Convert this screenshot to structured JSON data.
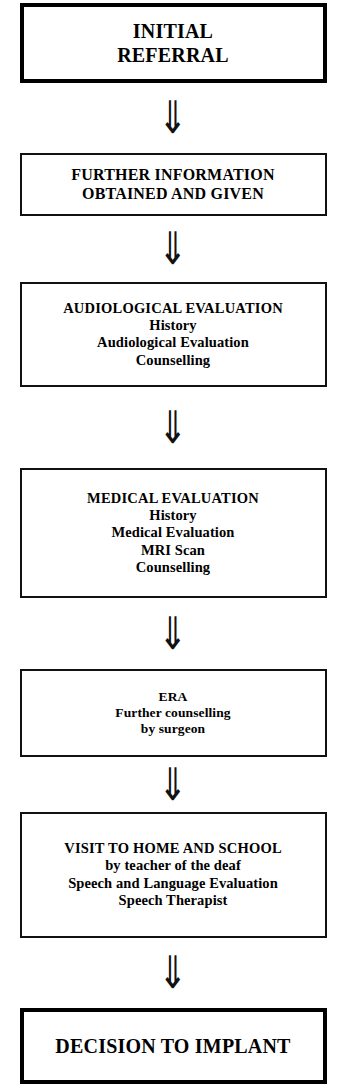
{
  "diagram": {
    "orientation": "vertical-top-down",
    "connector_glyph": "⇓",
    "connector_name": "double-down-arrow",
    "background_color": "#ffffff",
    "line_color": "#111111",
    "text_color": "#000000",
    "nodes": [
      {
        "id": "initial-referral",
        "title": "INITIAL\nREFERRAL",
        "lines": [],
        "emphasis": true,
        "size": "xl"
      },
      {
        "id": "further-information",
        "title": "FURTHER INFORMATION\nOBTAINED AND GIVEN",
        "lines": [],
        "emphasis": false,
        "size": "lg"
      },
      {
        "id": "audiological-evaluation",
        "title": "AUDIOLOGICAL EVALUATION",
        "lines": [
          "History",
          "Audiological Evaluation",
          "Counselling"
        ],
        "emphasis": false,
        "size": "md"
      },
      {
        "id": "medical-evaluation",
        "title": "MEDICAL EVALUATION",
        "lines": [
          "History",
          "Medical Evaluation",
          "MRI Scan",
          "Counselling"
        ],
        "emphasis": false,
        "size": "md"
      },
      {
        "id": "era",
        "title": "ERA",
        "lines": [
          "Further counselling",
          "by surgeon"
        ],
        "emphasis": false,
        "size": "sm"
      },
      {
        "id": "visit-home-school",
        "title": "VISIT TO HOME AND SCHOOL",
        "lines": [
          "by teacher of the deaf",
          "Speech and Language Evaluation",
          "Speech Therapist"
        ],
        "emphasis": false,
        "size": "md"
      },
      {
        "id": "decision-to-implant",
        "title": "DECISION TO IMPLANT",
        "lines": [],
        "emphasis": true,
        "size": "xl"
      }
    ]
  }
}
